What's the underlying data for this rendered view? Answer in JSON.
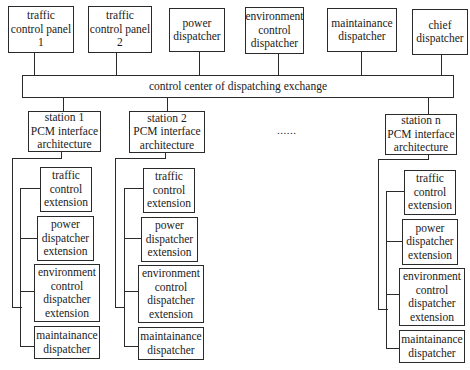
{
  "top_row": {
    "traffic_panel_1": "traffic\ncontrol panel\n1",
    "traffic_panel_2": "traffic\ncontrol panel\n2",
    "power_dispatcher": "power\ndispatcher",
    "environment_control_dispatcher": "environment\ncontrol\ndispatcher",
    "maintainance_dispatcher": "maintainance\ndispatcher",
    "chief_dispatcher": "chief\ndispatcher"
  },
  "control_center": {
    "label": "control center of dispatching exchange"
  },
  "stations": {
    "station_1": "station 1\nPCM interface\narchitecture",
    "station_2": "station 2\nPCM interface\narchitecture",
    "station_n": "station n\nPCM interface\narchitecture",
    "ellipsis": "......"
  },
  "extensions": {
    "traffic": "traffic\ncontrol\nextension",
    "power": "power\ndispatcher\nextension",
    "environment": "environment\ncontrol\ndispatcher\nextension",
    "maintainance": "maintainance\ndispatcher"
  }
}
